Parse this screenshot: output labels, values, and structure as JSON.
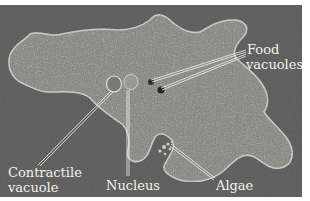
{
  "figure": {
    "background_color": "#5b5b5b",
    "cell_color": "#8a8a86",
    "label_color": "#f4f1ea",
    "labels": {
      "food_vacuoles_line1": "Food",
      "food_vacuoles_line2": "vacuoles",
      "contractile_vacuole_line1": "Contractile",
      "contractile_vacuole_line2": "vacuole",
      "nucleus": "Nucleus",
      "algae": "Algae"
    }
  }
}
